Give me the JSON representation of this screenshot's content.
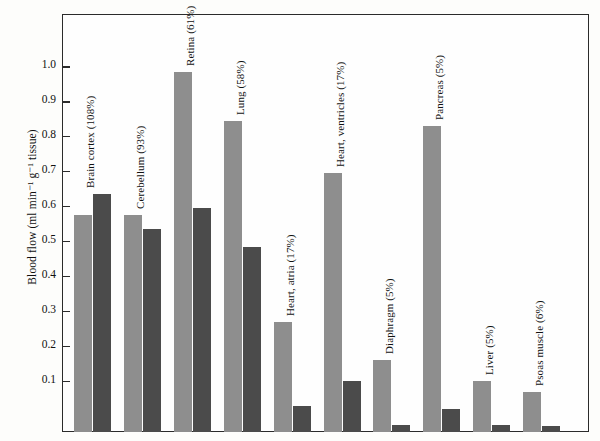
{
  "chart_data": {
    "type": "bar",
    "title": "",
    "xlabel": "",
    "ylabel": "Blood flow (ml min⁻¹ g⁻¹ tissue)",
    "ylim": [
      0,
      1.1
    ],
    "ytick_labels": [
      "0.1",
      "0.2",
      "0.3",
      "0.4",
      "0.5",
      "0.6",
      "0.7",
      "0.8",
      "0.9",
      "1.0"
    ],
    "ytick_values": [
      0.1,
      0.2,
      0.3,
      0.4,
      0.5,
      0.6,
      0.7,
      0.8,
      0.9,
      1.0
    ],
    "grid": false,
    "legend": null,
    "categories": [
      "Brain cortex (108%)",
      "Cerebellum (93%)",
      "Retina (61%)",
      "Lung (58%)",
      "Heart, atria (17%)",
      "Heart, ventricles (17%)",
      "Diaphragm (5%)",
      "Pancreas (5%)",
      "Liver (5%)",
      "Psoas muscle (6%)"
    ],
    "series": [
      {
        "name": "light-series",
        "color": "#8e8e8e",
        "values": [
          0.62,
          0.62,
          1.03,
          0.89,
          0.315,
          0.74,
          0.205,
          0.875,
          0.145,
          0.115
        ]
      },
      {
        "name": "dark-series",
        "color": "#4b4b4b",
        "values": [
          0.68,
          0.58,
          0.64,
          0.53,
          0.075,
          0.145,
          0.02,
          0.065,
          0.02,
          0.018
        ]
      }
    ]
  },
  "colors": {
    "light_bar": "#8e8e8e",
    "dark_bar": "#4b4b4b",
    "axis": "#2b2b2b",
    "text": "#111111",
    "background": "#fdfdfb"
  }
}
